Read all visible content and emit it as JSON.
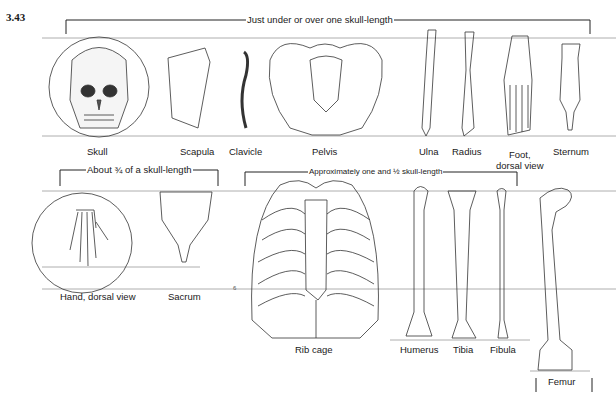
{
  "figure": {
    "number": "3.43",
    "brackets": [
      {
        "id": "top",
        "text": "Just under or over one skull-length"
      },
      {
        "id": "three-quarter",
        "text": "About ¾ of a skull-length"
      },
      {
        "id": "one-and-half",
        "text": "Approximately one and ½ skull-length"
      }
    ],
    "row1_labels": [
      "Skull",
      "Scapula",
      "Clavicle",
      "Pelvis",
      "Ulna",
      "Radius",
      "Foot,",
      "dorsal view",
      "Sternum"
    ],
    "row2_labels": [
      "Hand, dorsal view",
      "Sacrum",
      "Rib cage",
      "Humerus",
      "Tibia",
      "Fibula",
      "Femur"
    ],
    "margin_mark": "6"
  }
}
